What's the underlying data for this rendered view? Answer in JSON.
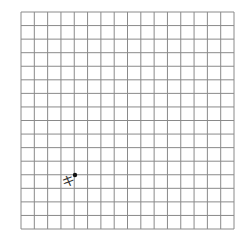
{
  "grid": {
    "columns": 16,
    "rows": 16,
    "left": 21,
    "top": 12,
    "right": 234,
    "bottom": 229,
    "line_color": "#8a8a8a",
    "background": "#ffffff"
  },
  "marker": {
    "x": 75,
    "y": 175,
    "radius": 2.2,
    "color": "#111111"
  },
  "annotation": {
    "text": "キ",
    "x": 62,
    "y": 175,
    "color": "#333333"
  }
}
